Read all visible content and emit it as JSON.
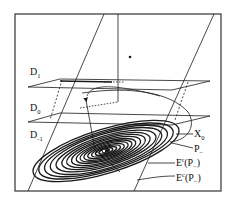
{
  "figure": {
    "type": "phase-space diagram",
    "labels": {
      "d1": {
        "base": "D",
        "sub": "1"
      },
      "d0": {
        "base": "D",
        "sub": "0"
      },
      "dm1": {
        "base": "D",
        "sub": "-1"
      },
      "x0": {
        "base": "X",
        "sub": "0"
      },
      "p_minus": {
        "base": "P",
        "sub": "−"
      },
      "eu": {
        "base": "E",
        "sup": "r",
        "arg": "(P",
        "argsub": "−",
        "close": ")"
      },
      "ec": {
        "base": "E",
        "sup": "c",
        "arg": "(P",
        "argsub": "−",
        "close": ")"
      }
    },
    "colors": {
      "line": "#1a1a1a",
      "frame": "#333333",
      "background": "#ffffff"
    }
  }
}
